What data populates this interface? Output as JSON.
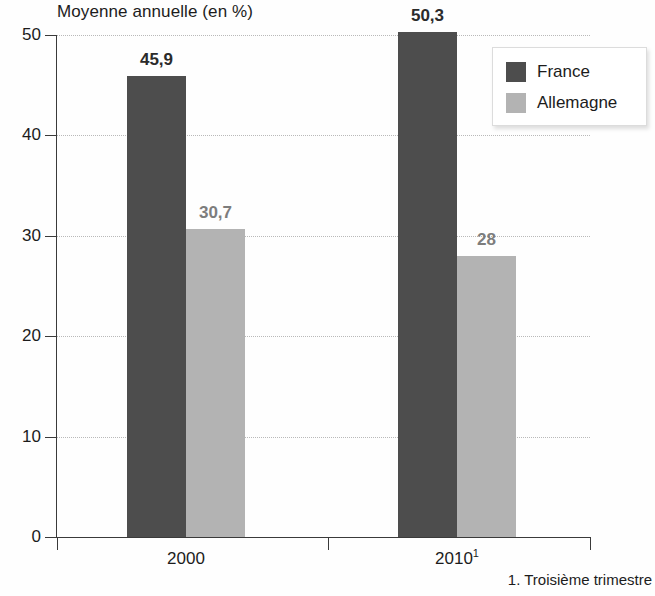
{
  "chart_data": {
    "type": "bar",
    "title": "Moyenne annuelle (en %)",
    "xlabel": "",
    "ylabel": "",
    "ylim": [
      0,
      50
    ],
    "yticks": [
      0,
      10,
      20,
      30,
      40,
      50
    ],
    "ytick_labels": [
      "0",
      "10",
      "20",
      "30",
      "40",
      "50"
    ],
    "grid": true,
    "legend_position": "top-right",
    "categories": [
      "2000",
      "2010"
    ],
    "category_labels": [
      "2000",
      "2010"
    ],
    "category_superscripts": [
      "",
      "1"
    ],
    "series": [
      {
        "name": "France",
        "color": "#4d4d4d",
        "values": [
          45.9,
          50.3
        ],
        "value_labels": [
          "45,9",
          "50,3"
        ],
        "label_color": "#2b2b2b"
      },
      {
        "name": "Allemagne",
        "color": "#b3b3b3",
        "values": [
          30.7,
          28
        ],
        "value_labels": [
          "30,7",
          "28"
        ],
        "label_color": "#7d7d7d"
      }
    ],
    "annotations": [
      "1. Troisième trimestre"
    ],
    "footnote": "1. Troisième trimestre"
  },
  "legend": {
    "items": [
      {
        "label": "France",
        "color": "#4d4d4d"
      },
      {
        "label": "Allemagne",
        "color": "#b3b3b3"
      }
    ]
  },
  "colors": {
    "france": "#4d4d4d",
    "allemagne": "#b3b3b3",
    "axis": "#3a3a3a",
    "grid": "#b9b9b9",
    "text": "#1c1c1c"
  }
}
